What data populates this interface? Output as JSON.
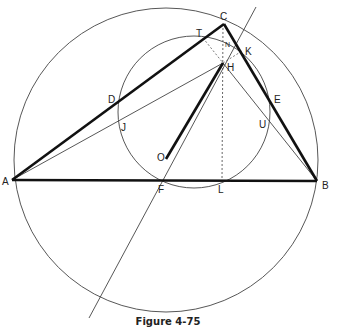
{
  "caption": "Figure 4-75",
  "colors": {
    "stroke": "#333333",
    "thick": "#111111",
    "background": "#ffffff"
  },
  "points": {
    "A": "A",
    "B": "B",
    "C": "C",
    "D": "D",
    "E": "E",
    "F": "F",
    "H": "H",
    "J": "J",
    "K": "K",
    "L": "L",
    "N": "N",
    "O": "O",
    "T": "T",
    "U": "U"
  }
}
